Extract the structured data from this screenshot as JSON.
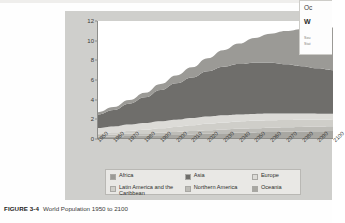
{
  "caption": {
    "figure_number": "FIGURE 3-4",
    "title": "World Population 1950 to 2100"
  },
  "overlay_panel": {
    "line1": "Oc",
    "line2": "W",
    "small1": "Sou",
    "small2": "Stat"
  },
  "legend": {
    "rows": [
      [
        {
          "label": "Africa",
          "color": "#9b9a96"
        },
        {
          "label": "Asia",
          "color": "#6f6e6b"
        },
        {
          "label": "Europe",
          "color": "#dcdbd7"
        }
      ],
      [
        {
          "label": "Latin America and the Caribbean",
          "color": "#cfcec9"
        },
        {
          "label": "Northern America",
          "color": "#bdbcb7"
        },
        {
          "label": "Oceania",
          "color": "#a8a7a2"
        }
      ]
    ]
  },
  "chart_data": {
    "type": "area",
    "stacked": true,
    "title": "World Population 1950 to 2100",
    "xlabel": "",
    "ylabel": "Billions",
    "ylim": [
      0,
      12
    ],
    "yticks": [
      0,
      2,
      4,
      6,
      8,
      10,
      12
    ],
    "grid": false,
    "legend_position": "bottom",
    "x": [
      1950,
      1960,
      1970,
      1980,
      1990,
      2000,
      2010,
      2020,
      2030,
      2040,
      2050,
      2060,
      2070,
      2080,
      2090,
      2100
    ],
    "series": [
      {
        "name": "Oceania",
        "color": "#a8a7a2",
        "values": [
          0.13,
          0.16,
          0.2,
          0.23,
          0.27,
          0.31,
          0.37,
          0.43,
          0.48,
          0.53,
          0.57,
          0.61,
          0.64,
          0.67,
          0.69,
          0.71
        ]
      },
      {
        "name": "Northern America",
        "color": "#bdbcb7",
        "values": [
          0.17,
          0.2,
          0.23,
          0.25,
          0.28,
          0.31,
          0.34,
          0.37,
          0.4,
          0.42,
          0.43,
          0.45,
          0.46,
          0.47,
          0.48,
          0.49
        ]
      },
      {
        "name": "Latin America and the Caribbean",
        "color": "#cfcec9",
        "values": [
          0.17,
          0.22,
          0.29,
          0.36,
          0.44,
          0.52,
          0.59,
          0.65,
          0.71,
          0.75,
          0.76,
          0.76,
          0.74,
          0.72,
          0.69,
          0.65
        ]
      },
      {
        "name": "Europe",
        "color": "#dcdbd7",
        "values": [
          0.55,
          0.6,
          0.66,
          0.69,
          0.72,
          0.73,
          0.74,
          0.75,
          0.74,
          0.72,
          0.71,
          0.69,
          0.67,
          0.65,
          0.64,
          0.63
        ]
      },
      {
        "name": "Asia",
        "color": "#6f6e6b",
        "values": [
          1.4,
          1.7,
          2.14,
          2.64,
          3.21,
          3.74,
          4.17,
          4.64,
          4.97,
          5.16,
          5.26,
          5.21,
          5.06,
          4.86,
          4.65,
          4.47
        ]
      },
      {
        "name": "Africa",
        "color": "#9b9a96",
        "values": [
          0.23,
          0.29,
          0.37,
          0.48,
          0.63,
          0.81,
          1.04,
          1.34,
          1.7,
          2.1,
          2.53,
          2.97,
          3.4,
          3.79,
          4.13,
          4.39
        ]
      }
    ],
    "totals": [
      2.53,
      3.03,
      3.7,
      4.46,
      5.33,
      6.14,
      7.21,
      8.18,
      9.0,
      9.68,
      10.26,
      10.69,
      10.97,
      11.16,
      11.28,
      11.34
    ]
  }
}
